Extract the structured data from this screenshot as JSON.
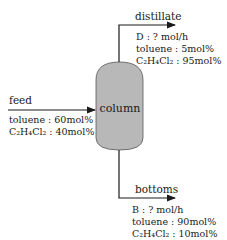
{
  "diagram": {
    "type": "process-flow",
    "unit": {
      "label": "column",
      "fill": "#b8b8b8"
    },
    "streams": {
      "feed": {
        "label": "feed",
        "composition": [
          {
            "text": "toluene : 60mol%"
          },
          {
            "text": "C₂H₄Cl₂ : 40mol%"
          }
        ]
      },
      "distillate": {
        "label": "distillate",
        "flow": "D : ? mol/h",
        "composition": [
          {
            "text": "toluene : 5mol%"
          },
          {
            "text": "C₂H₄Cl₂ : 95mol%"
          }
        ]
      },
      "bottoms": {
        "label": "bottoms",
        "flow": "B : ? mol/h",
        "composition": [
          {
            "text": "toluene : 90mol%"
          },
          {
            "text": "C₂H₄Cl₂ : 10mol%"
          }
        ]
      }
    },
    "colors": {
      "line": "#1a1a1a",
      "column_fill": "#b8b8b8"
    }
  }
}
